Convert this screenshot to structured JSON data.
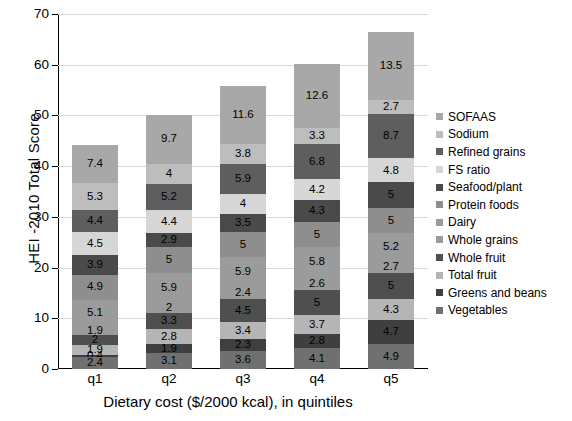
{
  "chart_data": {
    "type": "bar",
    "stacked": true,
    "title": "",
    "xlabel": "Dietary cost ($/2000 kcal), in quintiles",
    "ylabel": "HEI -2010 Total Score",
    "categories": [
      "q1",
      "q2",
      "q3",
      "q4",
      "q5"
    ],
    "ylim": [
      0,
      70
    ],
    "yticks": [
      0,
      10,
      20,
      30,
      40,
      50,
      60,
      70
    ],
    "grid": true,
    "legend_position": "right",
    "legend_order_top_to_bottom": [
      "SOFAAS",
      "Sodium",
      "Refined grains",
      "FS ratio",
      "Seafood/plant",
      "Protein foods",
      "Dairy",
      "Whole grains",
      "Whole fruit",
      "Total fruit",
      "Greens and beans",
      "Vegetables"
    ],
    "series": [
      {
        "name": "SOFAAS",
        "color": "#a8a8a8",
        "values": [
          7.4,
          9.7,
          11.6,
          12.6,
          13.5
        ]
      },
      {
        "name": "Sodium",
        "color": "#bdbdbd",
        "values": [
          5.3,
          4.0,
          3.8,
          3.3,
          2.7
        ]
      },
      {
        "name": "Refined grains",
        "color": "#5e5e5e",
        "values": [
          4.4,
          5.2,
          5.9,
          6.8,
          8.7
        ]
      },
      {
        "name": "FS ratio",
        "color": "#d6d6d6",
        "values": [
          4.5,
          4.4,
          4.0,
          4.2,
          4.8
        ]
      },
      {
        "name": "Seafood/plant",
        "color": "#4a4a4a",
        "values": [
          3.9,
          2.9,
          3.5,
          4.3,
          5.0
        ]
      },
      {
        "name": "Protein foods",
        "color": "#8e8e8e",
        "values": [
          4.9,
          5.0,
          5.0,
          5.0,
          5.0
        ]
      },
      {
        "name": "Dairy",
        "color": "#9b9b9b",
        "values": [
          5.1,
          5.9,
          5.9,
          5.8,
          5.2
        ]
      },
      {
        "name": "Whole grains",
        "color": "#9b9b9b",
        "values": [
          1.9,
          2.0,
          2.4,
          2.6,
          2.7
        ]
      },
      {
        "name": "Whole fruit",
        "color": "#4f4f4f",
        "values": [
          2.0,
          3.3,
          4.5,
          5.0,
          5.0
        ]
      },
      {
        "name": "Total fruit",
        "color": "#b5b5b5",
        "values": [
          1.9,
          2.8,
          3.4,
          3.7,
          4.3
        ]
      },
      {
        "name": "Greens and beans",
        "color": "#3f3f3f",
        "values": [
          0.4,
          1.9,
          2.3,
          2.8,
          4.7
        ]
      },
      {
        "name": "Vegetables",
        "color": "#707070",
        "values": [
          2.4,
          3.1,
          3.6,
          4.1,
          4.9
        ]
      }
    ],
    "bar_totals": [
      44.1,
      50.2,
      55.9,
      60.2,
      66.5
    ]
  },
  "axis": {
    "y_title": "HEI -2010 Total Score",
    "x_title": "Dietary cost ($/2000 kcal), in quintiles"
  }
}
